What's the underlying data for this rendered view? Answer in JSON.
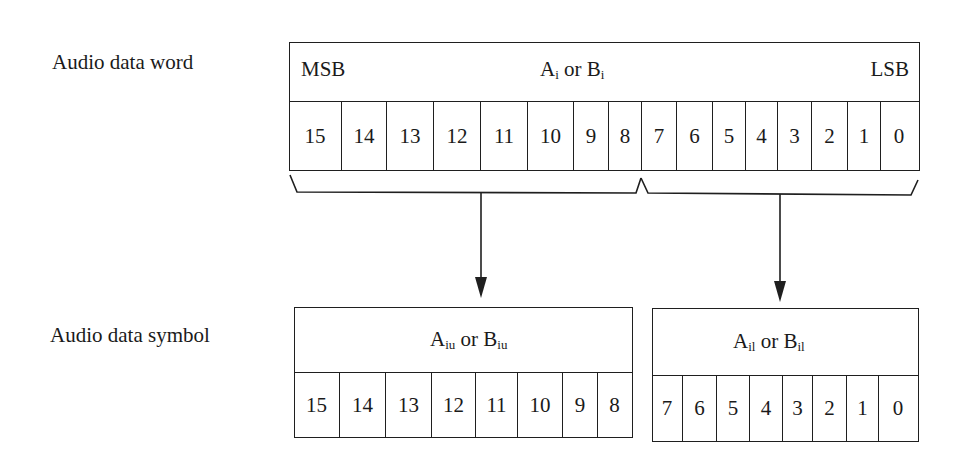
{
  "word": {
    "label": "Audio data word",
    "msb_label": "MSB",
    "lsb_label": "LSB",
    "center_label": {
      "a": "A",
      "a_sub": "i",
      "or": "or",
      "b": "B",
      "b_sub": "i"
    },
    "bits": [
      "15",
      "14",
      "13",
      "12",
      "11",
      "10",
      "9",
      "8",
      "7",
      "6",
      "5",
      "4",
      "3",
      "2",
      "1",
      "0"
    ],
    "cell_edges": [
      290,
      342,
      387,
      434,
      481,
      528,
      574,
      609,
      642,
      677,
      713,
      746,
      778,
      812,
      848,
      881,
      918
    ]
  },
  "symbol": {
    "label": "Audio data symbol",
    "upper": {
      "title": {
        "a": "A",
        "a_sub": "iu",
        "or": "or",
        "b": "B",
        "b_sub": "iu"
      },
      "bits": [
        "15",
        "14",
        "13",
        "12",
        "11",
        "10",
        "9",
        "8"
      ],
      "cell_edges": [
        295,
        340,
        386,
        432,
        476,
        518,
        563,
        598,
        632
      ]
    },
    "lower": {
      "title": {
        "a": "A",
        "a_sub": "il",
        "or": "or",
        "b": "B",
        "b_sub": "il"
      },
      "bits": [
        "7",
        "6",
        "5",
        "4",
        "3",
        "2",
        "1",
        "0"
      ],
      "cell_edges": [
        653,
        683,
        717,
        750,
        783,
        813,
        847,
        879,
        918
      ]
    }
  },
  "connectors": {
    "braces": [
      "upper-byte-brace",
      "lower-byte-brace"
    ],
    "arrows": [
      "upper-byte-arrow",
      "lower-byte-arrow"
    ]
  }
}
